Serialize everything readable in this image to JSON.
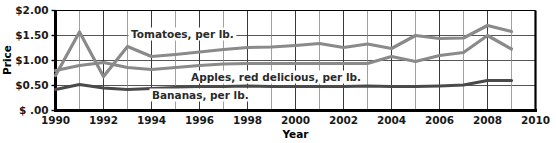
{
  "chart_data": {
    "type": "line",
    "title": "",
    "xlabel": "Year",
    "ylabel": "Price",
    "xlim": [
      1990,
      2010
    ],
    "ylim": [
      0,
      2.0
    ],
    "xticks": [
      1990,
      1992,
      1994,
      1996,
      1998,
      2000,
      2002,
      2004,
      2006,
      2008,
      2010
    ],
    "xtick_labels": [
      "1990",
      "1992",
      "1994",
      "1996",
      "1998",
      "2000",
      "2002",
      "2004",
      "2006",
      "2008",
      "2010"
    ],
    "yticks": [
      0,
      0.5,
      1.0,
      1.5,
      2.0
    ],
    "ytick_labels": [
      "$ .00",
      "$0.50",
      "$1.00",
      "$1.50",
      "$2.00"
    ],
    "grid": true,
    "legend_position": "inline-annotations",
    "x": [
      1990,
      1991,
      1992,
      1993,
      1994,
      1995,
      1996,
      1997,
      1998,
      1999,
      2000,
      2001,
      2002,
      2003,
      2004,
      2005,
      2006,
      2007,
      2008,
      2009
    ],
    "series": [
      {
        "name": "Tomatoes, per lb.",
        "color": "#8a8a8a",
        "values": [
          0.7,
          1.57,
          0.68,
          1.28,
          1.08,
          1.12,
          1.17,
          1.22,
          1.26,
          1.27,
          1.3,
          1.34,
          1.26,
          1.33,
          1.24,
          1.5,
          1.44,
          1.45,
          1.7,
          1.58
        ]
      },
      {
        "name": "Apples, red delicious, per lb.",
        "color": "#8a8a8a",
        "values": [
          0.8,
          0.9,
          0.96,
          0.86,
          0.82,
          0.86,
          0.9,
          0.93,
          0.94,
          0.94,
          0.94,
          0.94,
          0.94,
          0.94,
          1.08,
          0.98,
          1.1,
          1.16,
          1.5,
          1.23
        ]
      },
      {
        "name": "Bananas, per lb.",
        "color": "#4a4a4a",
        "values": [
          0.42,
          0.52,
          0.45,
          0.42,
          0.44,
          0.46,
          0.48,
          0.48,
          0.49,
          0.48,
          0.48,
          0.48,
          0.48,
          0.49,
          0.48,
          0.48,
          0.49,
          0.51,
          0.6,
          0.6
        ]
      }
    ],
    "annotations": [
      {
        "text": "Tomatoes, per lb.",
        "series": "Tomatoes, per lb."
      },
      {
        "text": "Apples, red delicious, per lb.",
        "series": "Apples, red delicious, per lb."
      },
      {
        "text": "Bananas, per lb.",
        "series": "Bananas, per lb."
      }
    ]
  }
}
